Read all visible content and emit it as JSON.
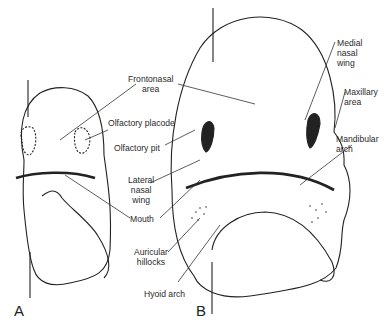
{
  "figure": {
    "panels": [
      {
        "id": "A",
        "label": "A"
      },
      {
        "id": "B",
        "label": "B"
      }
    ],
    "labels": {
      "frontonasal_area": "Frontonasal\narea",
      "olfactory_placode": "Olfactory placode",
      "olfactory_pit": "Olfactory pit",
      "lateral_nasal_wing": "Lateral\nnasal\nwing",
      "mouth": "Mouth",
      "auricular_hillocks": "Auricular\nhillocks",
      "hyoid_arch": "Hyoid arch",
      "medial_nasal_wing": "Medial\nnasal\nwing",
      "maxillary_area": "Maxillary\narea",
      "mandibular_arch": "Mandibular\narch"
    },
    "colors": {
      "ink": "#222222",
      "hatch": "#8a8a8a",
      "background": "#ffffff"
    }
  }
}
